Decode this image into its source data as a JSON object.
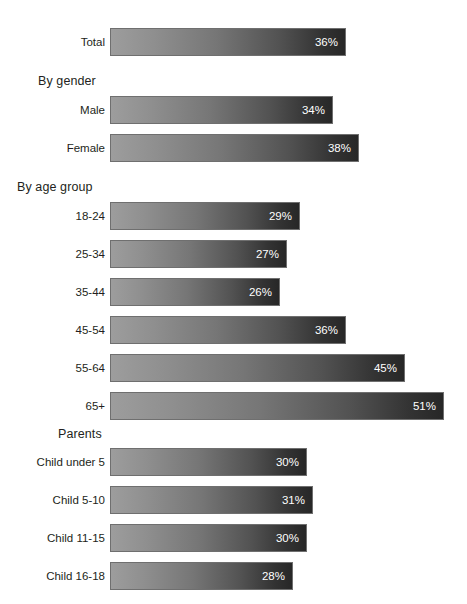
{
  "chart_data": {
    "type": "bar",
    "orientation": "horizontal",
    "title": "",
    "xlabel": "",
    "ylabel": "",
    "xlim": [
      0,
      55
    ],
    "grid": false,
    "legend": null,
    "value_suffix": "%",
    "categories": [
      "Total",
      "Male",
      "Female",
      "18-24",
      "25-34",
      "35-44",
      "45-54",
      "55-64",
      "65+",
      "Child under 5",
      "Child 5-10",
      "Child 11-15",
      "Child 16-18"
    ],
    "values": [
      36,
      34,
      38,
      29,
      27,
      26,
      36,
      45,
      51,
      30,
      31,
      30,
      28
    ],
    "group_headers": [
      "",
      "By gender",
      "By age group",
      "Parents"
    ],
    "groups": [
      {
        "header": "",
        "header_align": "none",
        "bars": [
          {
            "label": "Total",
            "value": 36,
            "value_label": "36%"
          }
        ]
      },
      {
        "header": "By gender",
        "header_align": "indent-medium",
        "bars": [
          {
            "label": "Male",
            "value": 34,
            "value_label": "34%"
          },
          {
            "label": "Female",
            "value": 38,
            "value_label": "38%"
          }
        ]
      },
      {
        "header": "By age group",
        "header_align": "indent-small",
        "bars": [
          {
            "label": "18-24",
            "value": 29,
            "value_label": "29%"
          },
          {
            "label": "25-34",
            "value": 27,
            "value_label": "27%"
          },
          {
            "label": "35-44",
            "value": 26,
            "value_label": "26%"
          },
          {
            "label": "45-54",
            "value": 36,
            "value_label": "36%"
          },
          {
            "label": "55-64",
            "value": 45,
            "value_label": "45%"
          },
          {
            "label": "65+",
            "value": 51,
            "value_label": "51%"
          }
        ]
      },
      {
        "header": "Parents",
        "header_align": "indent-large",
        "bars": [
          {
            "label": "Child under 5",
            "value": 30,
            "value_label": "30%"
          },
          {
            "label": "Child 5-10",
            "value": 31,
            "value_label": "31%"
          },
          {
            "label": "Child 11-15",
            "value": 30,
            "value_label": "30%"
          },
          {
            "label": "Child 16-18",
            "value": 28,
            "value_label": "28%"
          }
        ]
      }
    ],
    "colors": {
      "bar_gradient_start": "#9d9d9d",
      "bar_gradient_end": "#272727",
      "bar_border": "#6f6f6f",
      "value_text": "#ffffff",
      "label_text": "#231f20",
      "background": "#ffffff"
    }
  },
  "layout": {
    "bar_origin_x": 110,
    "px_per_percent": 6.55,
    "bar_height": 28,
    "row_pitch": 38,
    "label_right_edge": 105
  },
  "clipped_title": ""
}
